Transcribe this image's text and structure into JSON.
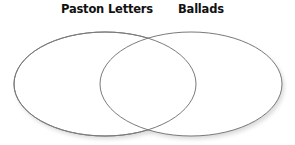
{
  "diagram": {
    "type": "venn",
    "sets": [
      {
        "label": "Paston Letters",
        "cx": 105,
        "cy": 84,
        "rx": 91,
        "ry": 52
      },
      {
        "label": "Ballads",
        "cx": 191,
        "cy": 84,
        "rx": 91,
        "ry": 52
      }
    ],
    "colors": {
      "stroke": "#7a7a7a",
      "fill": "#ffffff",
      "shadow": "#d8d8d8",
      "text": "#111111"
    }
  }
}
